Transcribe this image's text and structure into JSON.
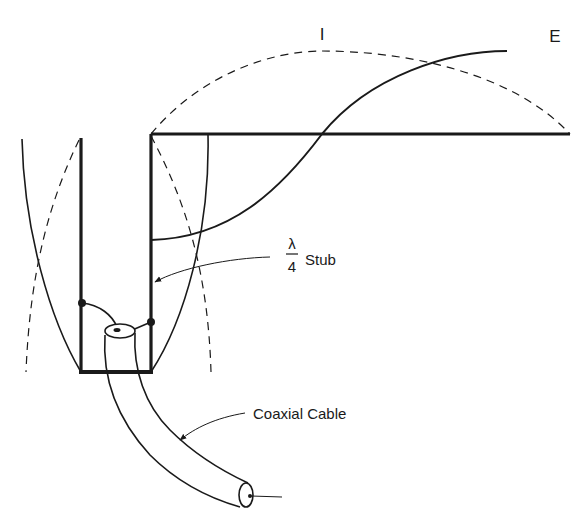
{
  "diagram": {
    "type": "antenna-schematic",
    "labels": {
      "current": "I",
      "voltage": "E",
      "stub_fraction_num": "λ",
      "stub_fraction_den": "4",
      "stub": "Stub",
      "coax": "Coaxial Cable"
    },
    "colors": {
      "ink": "#1a1a1a",
      "background": "#ffffff"
    },
    "elements": [
      {
        "name": "radiator",
        "kind": "horizontal element"
      },
      {
        "name": "quarter-wave-stub",
        "kind": "U-shaped stub"
      },
      {
        "name": "current-distribution",
        "style": "dashed",
        "label": "I"
      },
      {
        "name": "voltage-distribution",
        "style": "solid",
        "label": "E"
      },
      {
        "name": "coaxial-cable",
        "label": "Coaxial Cable"
      }
    ]
  }
}
